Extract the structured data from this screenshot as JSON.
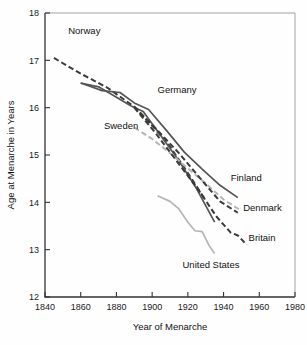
{
  "chart_data": {
    "type": "line",
    "title": "",
    "xlabel": "Year of Menarche",
    "ylabel": "Age at Menarche in Years",
    "xlim": [
      1840,
      1980
    ],
    "ylim": [
      12,
      18
    ],
    "xticks": [
      1840,
      1860,
      1880,
      1900,
      1920,
      1940,
      1960,
      1980
    ],
    "yticks": [
      12,
      13,
      14,
      15,
      16,
      17,
      18
    ],
    "grid": false,
    "legend_position": "inline-annotations",
    "series": [
      {
        "name": "Norway",
        "style": "dashed",
        "color": "#3a3a3a",
        "label_x": 1853,
        "label_y": 17.55,
        "x": [
          1845,
          1860,
          1875,
          1890,
          1900,
          1910,
          1920,
          1930
        ],
        "y": [
          17.05,
          16.72,
          16.42,
          16.02,
          15.62,
          15.18,
          14.62,
          14.04
        ]
      },
      {
        "name": "Sweden",
        "style": "solid",
        "color": "#555555",
        "label_x": 1873,
        "label_y": 15.55,
        "x": [
          1860,
          1870,
          1880,
          1888,
          1895,
          1905,
          1915,
          1925,
          1935
        ],
        "y": [
          16.52,
          16.44,
          16.22,
          16.04,
          15.92,
          15.4,
          14.88,
          14.28,
          13.58
        ]
      },
      {
        "name": "Germany",
        "style": "solid",
        "color": "#555555",
        "label_x": 1903,
        "label_y": 16.3,
        "x": [
          1860,
          1872,
          1882,
          1890,
          1898,
          1908,
          1918,
          1928,
          1938,
          1948
        ],
        "y": [
          16.52,
          16.36,
          16.32,
          16.1,
          15.96,
          15.52,
          15.06,
          14.7,
          14.36,
          14.1
        ]
      },
      {
        "name": "Finland",
        "style": "dashed",
        "color": "#b5b5b5",
        "label_x": 1944,
        "label_y": 14.45,
        "x": [
          1890,
          1900,
          1910,
          1920,
          1930,
          1940,
          1950
        ],
        "y": [
          15.58,
          15.34,
          15.04,
          14.72,
          14.4,
          14.06,
          13.82
        ]
      },
      {
        "name": "Denmark",
        "style": "dashed",
        "color": "#3a3a3a",
        "label_x": 1951,
        "label_y": 13.82,
        "x": [
          1890,
          1902,
          1915,
          1928,
          1938,
          1948
        ],
        "y": [
          16.02,
          15.56,
          15.04,
          14.46,
          14.02,
          13.78
        ]
      },
      {
        "name": "Britain",
        "style": "dashed",
        "color": "#3a3a3a",
        "label_x": 1954,
        "label_y": 13.18,
        "x": [
          1890,
          1902,
          1914,
          1926,
          1936,
          1944,
          1948,
          1953
        ],
        "y": [
          16.0,
          15.46,
          14.86,
          14.26,
          13.7,
          13.36,
          13.3,
          13.1
        ]
      },
      {
        "name": "United States",
        "style": "solid",
        "color": "#b5b5b5",
        "label_x": 1917,
        "label_y": 12.62,
        "x": [
          1903,
          1910,
          1915,
          1920,
          1924,
          1928,
          1932,
          1935
        ],
        "y": [
          14.14,
          14.02,
          13.86,
          13.58,
          13.4,
          13.38,
          13.08,
          12.92
        ]
      }
    ]
  }
}
